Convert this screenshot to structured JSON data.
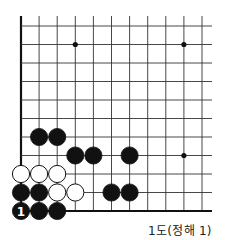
{
  "diagram": {
    "title": "1도(정해 1)",
    "board": {
      "x0": 21,
      "y0": 26,
      "dx": 18.1,
      "dy": 18.5,
      "cols": 11,
      "rows": 11,
      "top_extend": 16,
      "right_extend": 212,
      "line_color": "#333333",
      "edge_color": "#111111"
    },
    "star_points": [
      {
        "col": 3,
        "row": 1
      },
      {
        "col": 9,
        "row": 1
      },
      {
        "col": 9,
        "row": 7
      }
    ],
    "stones": [
      {
        "color": "black",
        "col": 1,
        "row": 6
      },
      {
        "color": "black",
        "col": 2,
        "row": 6
      },
      {
        "color": "black",
        "col": 3,
        "row": 7
      },
      {
        "color": "black",
        "col": 4,
        "row": 7
      },
      {
        "color": "black",
        "col": 6,
        "row": 7
      },
      {
        "color": "white",
        "col": 0,
        "row": 8
      },
      {
        "color": "white",
        "col": 1,
        "row": 8
      },
      {
        "color": "white",
        "col": 2,
        "row": 8
      },
      {
        "color": "black",
        "col": 0,
        "row": 9
      },
      {
        "color": "black",
        "col": 1,
        "row": 9
      },
      {
        "color": "white",
        "col": 2,
        "row": 9
      },
      {
        "color": "white",
        "col": 3,
        "row": 9
      },
      {
        "color": "black",
        "col": 5,
        "row": 9
      },
      {
        "color": "black",
        "col": 6,
        "row": 9
      },
      {
        "color": "black",
        "col": 0,
        "row": 10,
        "label": "1"
      },
      {
        "color": "black",
        "col": 1,
        "row": 10
      },
      {
        "color": "black",
        "col": 2,
        "row": 10
      }
    ]
  }
}
